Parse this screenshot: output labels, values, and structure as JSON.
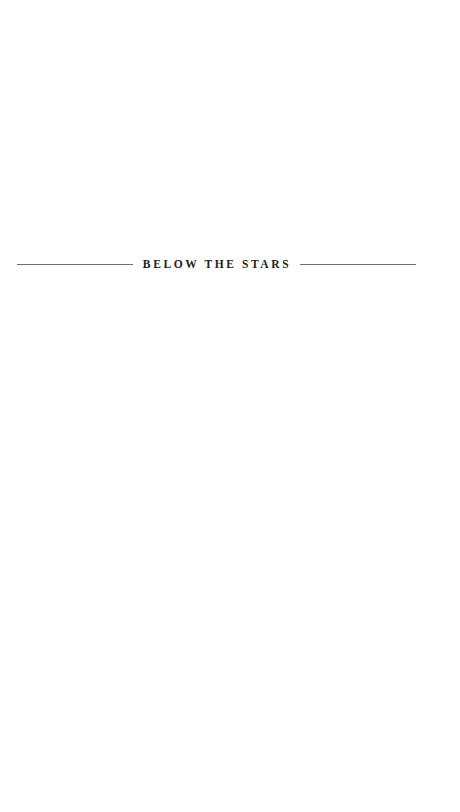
{
  "page": {
    "section_heading": "BELOW THE STARS",
    "colors": {
      "background": "#ffffff",
      "text": "#222222",
      "rule": "#6f6f6f"
    }
  }
}
